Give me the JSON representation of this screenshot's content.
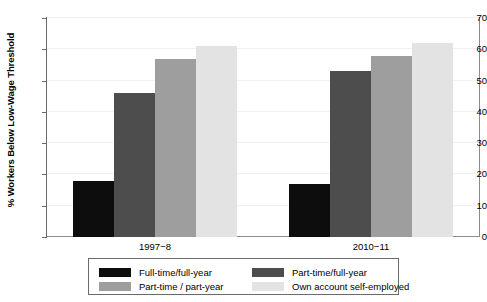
{
  "chart_data": {
    "type": "bar",
    "title": "",
    "subtitle": "",
    "xlabel": "",
    "ylabel": "% Workers Below Low-Wage Threshold",
    "categories": [
      "1997−8",
      "2010−11"
    ],
    "ylim": [
      0,
      70
    ],
    "y_ticks": [
      0,
      10,
      20,
      30,
      40,
      50,
      60,
      70
    ],
    "y_tick_labels": [
      "0",
      "10",
      "20",
      "30",
      "40",
      "50",
      "60",
      "70"
    ],
    "grid": true,
    "legend_position": "bottom",
    "series": [
      {
        "name": "Full-time/full-year",
        "color": "#0d0d0d",
        "values": [
          18,
          17
        ]
      },
      {
        "name": "Part-time/full-year",
        "color": "#4d4d4d",
        "values": [
          46,
          53
        ]
      },
      {
        "name": "Part-time / part-year",
        "color": "#9e9e9e",
        "values": [
          57,
          58
        ]
      },
      {
        "name": "Own account self-employed",
        "color": "#e3e3e3",
        "values": [
          61,
          62
        ]
      }
    ]
  },
  "legend": {
    "entries": [
      {
        "label": "Full-time/full-year",
        "color": "#0d0d0d"
      },
      {
        "label": "Part-time/full-year",
        "color": "#4d4d4d"
      },
      {
        "label": "Part-time / part-year",
        "color": "#9e9e9e"
      },
      {
        "label": "Own account self-employed",
        "color": "#e3e3e3"
      }
    ]
  },
  "axis": {
    "y_title": "% Workers Below Low-Wage Threshold",
    "x_tick_labels": [
      "1997−8",
      "2010−11"
    ],
    "y_tick_labels": [
      "0",
      "10",
      "20",
      "30",
      "40",
      "50",
      "60",
      "70"
    ]
  }
}
